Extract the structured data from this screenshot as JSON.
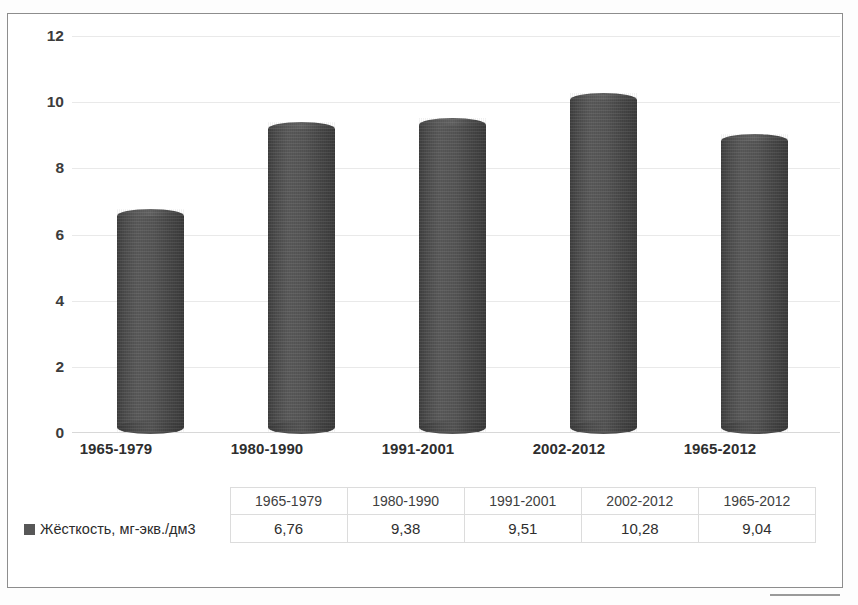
{
  "chart_data": {
    "type": "bar",
    "title": "",
    "xlabel": "",
    "ylabel": "",
    "categories": [
      "1965-1979",
      "1980-1990",
      "1991-2001",
      "2002-2012",
      "1965-2012"
    ],
    "values": [
      6.76,
      9.38,
      9.51,
      10.28,
      9.04
    ],
    "value_labels": [
      "6,76",
      "9,38",
      "9,51",
      "10,28",
      "9,04"
    ],
    "series": [
      {
        "name": "Жёсткость, мг-экв./дм3",
        "values": [
          6.76,
          9.38,
          9.51,
          10.28,
          9.04
        ],
        "color": "#4f4f4f"
      }
    ],
    "ylim": [
      0,
      12
    ],
    "yticks": [
      0,
      2,
      4,
      6,
      8,
      10,
      12
    ],
    "ytick_labels": [
      "0",
      "2",
      "4",
      "6",
      "8",
      "10",
      "12"
    ],
    "grid": true,
    "legend_position": "bottom-table",
    "bar_style": "cylinder"
  },
  "axis": {
    "yticks": [
      "12",
      "10",
      "8",
      "6",
      "4",
      "2",
      "0"
    ]
  },
  "categories": {
    "c0": "1965-1979",
    "c1": "1980-1990",
    "c2": "1991-2001",
    "c3": "2002-2012",
    "c4": "1965-2012"
  },
  "table": {
    "headers": [
      "1965-1979",
      "1980-1990",
      "1991-2001",
      "2002-2012",
      "1965-2012"
    ],
    "row_label": "Жёсткость, мг-экв./дм3",
    "values": [
      "6,76",
      "9,38",
      "9,51",
      "10,28",
      "9,04"
    ],
    "h0": "1965-1979",
    "h1": "1980-1990",
    "h2": "1991-2001",
    "h3": "2002-2012",
    "h4": "1965-2012",
    "v0": "6,76",
    "v1": "9,38",
    "v2": "9,51",
    "v3": "10,28",
    "v4": "9,04"
  },
  "colors": {
    "bar": "#4f4f4f",
    "legend_swatch": "#575757",
    "gridline": "#e9e9e9",
    "frame": "#8d8d8d"
  }
}
